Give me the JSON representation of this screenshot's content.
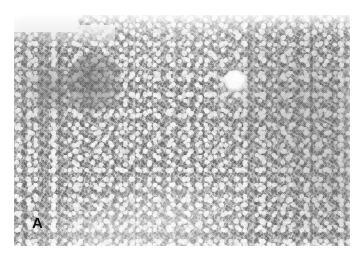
{
  "figure": {
    "kind": "photomicrograph",
    "modality": "light-microscopy",
    "stain_appearance": "grayscale",
    "panel_label": "A",
    "caption": "",
    "background_color": "#ffffff"
  },
  "plate": {
    "left_px": 14,
    "top_px": 15,
    "width_px": 336,
    "height_px": 231,
    "base_tone": "#b4b4b2",
    "light_tone": "#eceeea",
    "dark_tone": "#6a6c68"
  },
  "features": [
    {
      "name": "blank-corner",
      "description": "pale tissue-free region at the upper-left corner of the section",
      "color": "#eceeea"
    },
    {
      "name": "portal-tract",
      "description": "darker densely cellular portal tract / lymphoid aggregate at left of centre",
      "color": "#60625e"
    },
    {
      "name": "portal-tract-2",
      "description": "second smaller darker cellular cluster toward the left margin",
      "color": "#686a66"
    },
    {
      "name": "central-vein",
      "description": "bright round vascular lumen in the upper right of centre",
      "color": "#ffffff"
    },
    {
      "name": "parenchyma",
      "description": "mottled mid-grey parenchyma with pale sinusoidal lacunae throughout",
      "color": "#b4b4b2"
    },
    {
      "name": "pale-field",
      "description": "lighter, washed-out tissue across the lower centre of the field",
      "color": "#d6d7d3"
    },
    {
      "name": "dense-field",
      "description": "darker, more densely packed tissue across the right half of the field",
      "color": "#9a9c98"
    }
  ],
  "label": {
    "text": "A",
    "color": "#121212",
    "position": "bottom-left"
  }
}
